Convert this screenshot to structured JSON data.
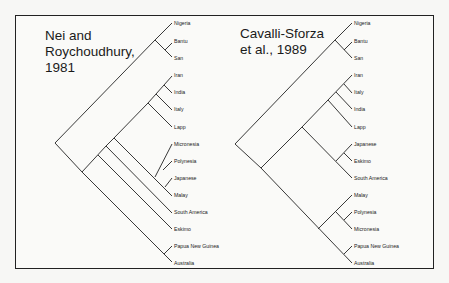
{
  "left_tree": {
    "title": "Nei and\nRoychoudhury,\n1981",
    "leaves": [
      "Nigeria",
      "Bantu",
      "San",
      "Iran",
      "India",
      "Italy",
      "Lapp",
      "Micronesia",
      "Polynesia",
      "Japanese",
      "Malay",
      "South America",
      "Eskimo",
      "Papua New Guinea",
      "Australia"
    ]
  },
  "right_tree": {
    "title": "Cavalli-Sforza\n et al., 1989",
    "leaves": [
      "Nigeria",
      "Bantu",
      "San",
      "Iran",
      "Italy",
      "India",
      "Lapp",
      "Japanese",
      "Eskimo",
      "South America",
      "Malay",
      "Polynesia",
      "Micronesia",
      "Papua New Guinea",
      "Australia"
    ]
  }
}
